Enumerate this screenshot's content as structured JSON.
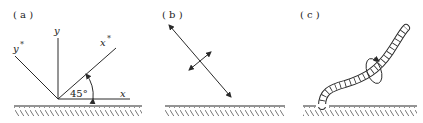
{
  "panels": [
    {
      "id": "a",
      "label": "( a )",
      "axes": {
        "y": "y",
        "y_star": "y",
        "x_star": "x",
        "x": "x",
        "star": "*"
      },
      "angle": "45°"
    },
    {
      "id": "b",
      "label": "( b )"
    },
    {
      "id": "c",
      "label": "( c )"
    }
  ],
  "colors": {
    "line": "#2a2a2a",
    "text": "#222222"
  }
}
